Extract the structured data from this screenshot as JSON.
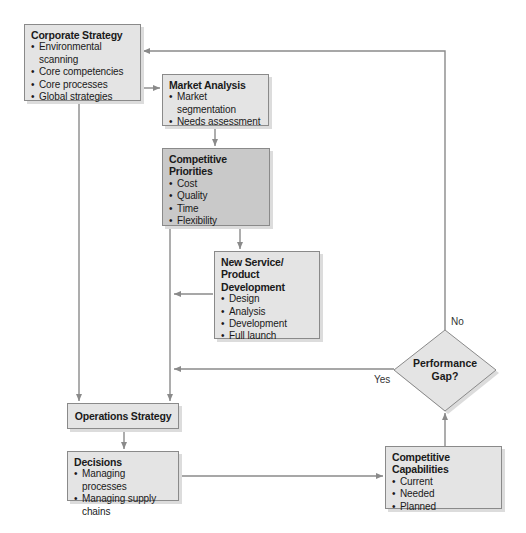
{
  "colors": {
    "box_fill": "#e4e4e4",
    "highlight_fill": "#c9c9c9",
    "line": "#8a8a8a"
  },
  "nodes": {
    "corporate_strategy": {
      "title": "Corporate Strategy",
      "items": [
        "Environmental scanning",
        "Core competencies",
        "Core processes",
        "Global strategies"
      ]
    },
    "market_analysis": {
      "title": "Market Analysis",
      "items": [
        "Market segmentation",
        "Needs assessment"
      ]
    },
    "competitive_priorities": {
      "title": "Competitive Priorities",
      "items": [
        "Cost",
        "Quality",
        "Time",
        "Flexibility"
      ]
    },
    "new_service": {
      "title_line1": "New Service/",
      "title_line2": "Product Development",
      "items": [
        "Design",
        "Analysis",
        "Development",
        "Full launch"
      ]
    },
    "operations_strategy": {
      "title": "Operations Strategy"
    },
    "decisions": {
      "title": "Decisions",
      "items": [
        "Managing processes",
        "Managing supply chains"
      ]
    },
    "competitive_capabilities": {
      "title": "Competitive Capabilities",
      "items": [
        "Current",
        "Needed",
        "Planned"
      ]
    },
    "performance_gap": {
      "line1": "Performance",
      "line2": "Gap?"
    }
  },
  "edge_labels": {
    "no": "No",
    "yes": "Yes"
  }
}
